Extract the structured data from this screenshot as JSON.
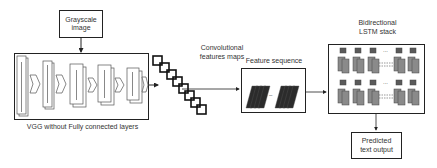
{
  "diagram": {
    "input": {
      "line1": "Grayscale",
      "line2": "image"
    },
    "vgg": {
      "caption": "VGG  without Fully connected layers",
      "stage_count": 5,
      "stage_labels": [
        "64",
        "128",
        "256",
        "512",
        "512"
      ]
    },
    "conv_maps": {
      "line1": "Convolutional",
      "line2": "features maps",
      "map_count": 8
    },
    "feature_sequence": {
      "title": "Feature sequence",
      "separator": "..."
    },
    "lstm": {
      "line1": "Bidirectional",
      "line2": "LSTM stack",
      "ellipsis": "..."
    },
    "output": {
      "line1": "Predicted",
      "line2": "text output"
    },
    "colors": {
      "line": "#222222",
      "block_dark": "#2b2b2b",
      "lstm_cell": "#8a8a8a",
      "lstm_cell_dark": "#5a5a5a"
    }
  }
}
